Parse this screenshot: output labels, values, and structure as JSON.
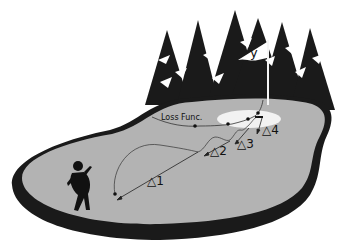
{
  "diagram": {
    "type": "golf-course metaphor for optimization",
    "labels": {
      "loss_function": "Loss Func.",
      "target": "y",
      "steps": [
        "△1",
        "△2",
        "△3",
        "△4"
      ]
    },
    "elements": {
      "golfer": "golfer-silhouette",
      "flag": "flag-with-target-y",
      "green": "putting-green-ellipse",
      "trees": "pine-tree-background",
      "course": "grey-fairway-with-dark-border"
    },
    "colors": {
      "fairway": "#b3b3b3",
      "border": "#1a1a1a",
      "trees": "#1a1a1a",
      "green_hole": "#f2f2f2",
      "lines": "#222222"
    }
  }
}
